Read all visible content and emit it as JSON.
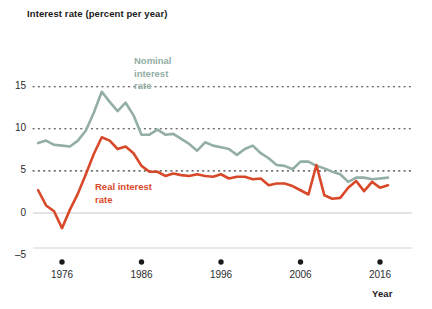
{
  "chart_data": {
    "type": "line",
    "title": "Interest rate (percent per year)",
    "xlabel": "Year",
    "ylabel": "Interest rate (percent per year)",
    "xlim": [
      1972,
      2018
    ],
    "ylim": [
      -5,
      15
    ],
    "yticks": [
      -5,
      0,
      5,
      10,
      15
    ],
    "ytick_labels": [
      "–5",
      "0",
      "5",
      "10",
      "15"
    ],
    "xticks": [
      1976,
      1986,
      1996,
      2006,
      2016
    ],
    "xtick_labels": [
      "1976",
      "1986",
      "1996",
      "2006",
      "2016"
    ],
    "grid": "dotted horizontal gridlines at 5, 10, 15; solid axis line at 0",
    "legend": "inline labels on curves",
    "colors": {
      "nominal": "#93aea5",
      "real": "#d8492a",
      "axis": "#bfbfbf",
      "text": "#1a1a1a"
    },
    "x": [
      1973,
      1974,
      1975,
      1976,
      1977,
      1978,
      1979,
      1980,
      1981,
      1982,
      1983,
      1984,
      1985,
      1986,
      1987,
      1988,
      1989,
      1990,
      1991,
      1992,
      1993,
      1994,
      1995,
      1996,
      1997,
      1998,
      1999,
      2000,
      2001,
      2002,
      2003,
      2004,
      2005,
      2006,
      2007,
      2008,
      2009,
      2010,
      2011,
      2012,
      2013,
      2014,
      2015,
      2016,
      2017
    ],
    "series": [
      {
        "name": "Nominal interest rate",
        "label_lines": [
          "Nominal",
          "interest",
          "rate"
        ],
        "color": "#93aea5",
        "values": [
          8.3,
          8.6,
          8.1,
          8.0,
          7.9,
          8.6,
          9.8,
          11.9,
          14.4,
          13.2,
          12.1,
          13.1,
          11.6,
          9.3,
          9.3,
          9.9,
          9.3,
          9.4,
          8.8,
          8.2,
          7.4,
          8.4,
          8.0,
          7.8,
          7.6,
          6.9,
          7.6,
          8.0,
          7.1,
          6.5,
          5.7,
          5.6,
          5.2,
          6.1,
          6.1,
          5.6,
          5.3,
          4.9,
          4.6,
          3.7,
          4.2,
          4.2,
          4.0,
          4.1,
          4.2
        ]
      },
      {
        "name": "Real interest rate",
        "label_lines": [
          "Real interest",
          "rate"
        ],
        "color": "#d8492a",
        "values": [
          2.7,
          0.9,
          0.2,
          -1.8,
          0.4,
          2.3,
          4.6,
          7.0,
          9.0,
          8.6,
          7.6,
          7.9,
          7.1,
          5.6,
          4.9,
          4.9,
          4.4,
          4.7,
          4.5,
          4.4,
          4.6,
          4.4,
          4.3,
          4.6,
          4.1,
          4.3,
          4.3,
          4.0,
          4.1,
          3.3,
          3.5,
          3.5,
          3.2,
          2.7,
          2.2,
          5.7,
          2.1,
          1.7,
          1.8,
          3.0,
          3.8,
          2.6,
          3.7,
          3.0,
          3.3
        ]
      }
    ]
  }
}
